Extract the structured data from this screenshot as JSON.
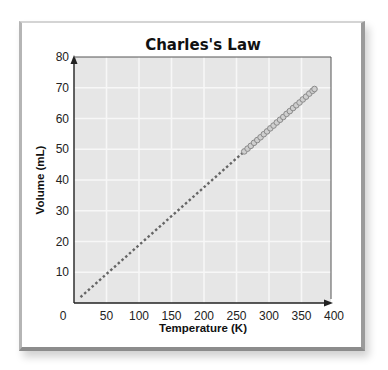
{
  "chart_data": {
    "type": "line",
    "title": "Charles's Law",
    "xlabel": "Temperature (K)",
    "ylabel": "Volume (mL)",
    "xlim": [
      0,
      400
    ],
    "ylim": [
      0,
      80
    ],
    "x_ticks": [
      0,
      50,
      100,
      150,
      200,
      250,
      300,
      350,
      400
    ],
    "y_ticks": [
      10,
      20,
      30,
      40,
      50,
      60,
      70,
      80
    ],
    "grid": true,
    "series": [
      {
        "name": "extrapolation",
        "style": "dotted",
        "x": [
          10,
          262
        ],
        "y": [
          1.9,
          49.3
        ]
      },
      {
        "name": "measured",
        "style": "markers",
        "x": [
          262,
          267,
          272,
          277,
          282,
          287,
          292,
          297,
          302,
          307,
          312,
          317,
          322,
          327,
          332,
          337,
          342,
          347,
          352,
          357,
          362,
          367,
          370
        ],
        "y": [
          49.3,
          50.2,
          51.1,
          52.1,
          53.0,
          53.9,
          54.9,
          55.8,
          56.8,
          57.7,
          58.7,
          59.6,
          60.5,
          61.5,
          62.4,
          63.4,
          64.3,
          65.2,
          66.2,
          67.1,
          68.1,
          69.0,
          69.6
        ]
      }
    ],
    "colors": {
      "plot_bg": "#e6e6e6",
      "grid": "#f7f7f7",
      "axis": "#222222",
      "line": "#666666",
      "marker_fill": "#cfcfcf",
      "marker_stroke": "#8a8a8a"
    }
  }
}
